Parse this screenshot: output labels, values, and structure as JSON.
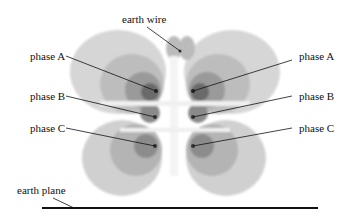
{
  "labels": {
    "earth_wire": "earth wire",
    "phase_a_left": "phase A",
    "phase_b_left": "phase B",
    "phase_c_left": "phase C",
    "phase_a_right": "phase A",
    "phase_b_right": "phase B",
    "phase_c_right": "phase C",
    "earth_plane": "earth plane"
  },
  "colors": {
    "field_outer": "#c8c8c8",
    "field_mid": "#a8a8a8",
    "field_inner": "#7a7a7a",
    "field_core": "#3a3a3a",
    "ground_line": "#111111"
  }
}
